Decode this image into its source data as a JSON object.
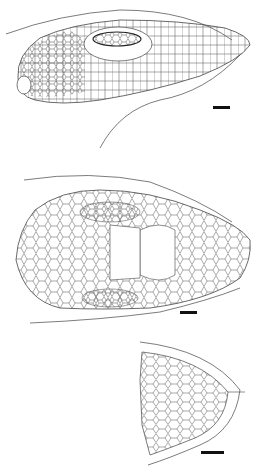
{
  "figure": {
    "panels": [
      {
        "id": "lateral",
        "view": "lateral view of head",
        "scale_bar": {
          "x": 213,
          "y": 106,
          "w": 17,
          "h": 3
        }
      },
      {
        "id": "dorsal",
        "view": "dorsal view of head",
        "scale_bar": {
          "x": 180,
          "y": 311,
          "w": 17,
          "h": 3
        }
      },
      {
        "id": "ventral-snout",
        "view": "ventral view of snout / chin",
        "scale_bar": {
          "x": 201,
          "y": 451,
          "w": 23,
          "h": 3
        }
      }
    ],
    "colors": {
      "line": "#444444",
      "background": "#ffffff",
      "scale_bar": "#111111"
    }
  }
}
